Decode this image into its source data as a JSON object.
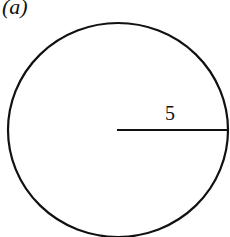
{
  "figure": {
    "label": "(a)",
    "radius_label": "5",
    "colors": {
      "stroke": "#111111",
      "background": "#ffffff"
    }
  }
}
